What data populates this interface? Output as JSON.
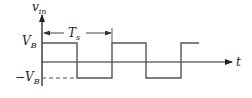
{
  "diagram": {
    "type": "square-wave",
    "y_axis_label": {
      "main": "v",
      "sub": "in"
    },
    "x_axis_label": "t",
    "high_level_label": {
      "main": "V",
      "sub": "B"
    },
    "low_level_label": {
      "prefix": "−",
      "main": "V",
      "sub": "B"
    },
    "period_label": {
      "main": "T",
      "sub": "s"
    },
    "colors": {
      "waveform": "#555555",
      "axis": "#222222"
    }
  }
}
